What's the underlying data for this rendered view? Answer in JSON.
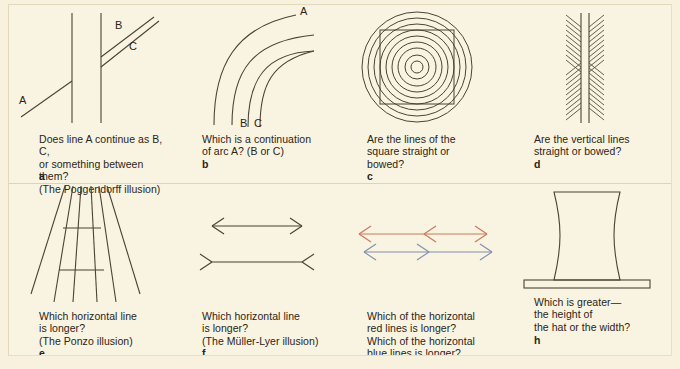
{
  "figure": {
    "background_color": "#f9f3e1",
    "ink_color": "#4a4334",
    "red_color": "#c9795c",
    "blue_color": "#8190ad"
  },
  "panels": [
    {
      "id": "a",
      "letter": "a",
      "name": "poggendorff",
      "caption": "Does line A continue as B, C,\nor something between them?\n(The Poggendorff illusion)",
      "labels": {
        "a": "A",
        "b": "B",
        "c": "C"
      }
    },
    {
      "id": "b",
      "letter": "b",
      "name": "arc-continuation",
      "caption": "Which is a continuation\nof arc A? (B or C)",
      "labels": {
        "a": "A",
        "b": "B",
        "c": "C"
      }
    },
    {
      "id": "c",
      "letter": "c",
      "name": "ehrenstein-square-circles",
      "caption": "Are the lines of the\nsquare straight or\nbowed?",
      "circle_count": 9
    },
    {
      "id": "d",
      "letter": "d",
      "name": "hering-chevron-vertical-lines",
      "caption": "Are the vertical lines\nstraight or bowed?",
      "vertical_line_count": 2
    },
    {
      "id": "e",
      "letter": "e",
      "name": "ponzo",
      "caption": "Which horizontal line\nis longer?\n(The Ponzo illusion)",
      "converging_line_count": 6,
      "horizontal_line_count": 2
    },
    {
      "id": "f",
      "letter": "f",
      "name": "muller-lyer",
      "caption": "Which horizontal line\nis longer?\n(The Müller-Lyer illusion)",
      "horizontal_line_count": 2
    },
    {
      "id": "g",
      "letter": "g",
      "name": "colored-arrow-segments",
      "caption": "Which of the horizontal\nred lines is longer?\nWhich of the horizontal\nblue lines is longer?"
    },
    {
      "id": "h",
      "letter": "h",
      "name": "top-hat",
      "caption": "Which is greater—\nthe height of\nthe hat or the width?"
    }
  ]
}
